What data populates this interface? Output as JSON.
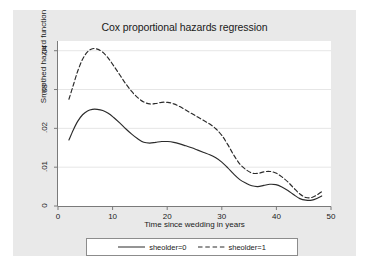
{
  "chart_data": {
    "type": "line",
    "title": "Cox proportional hazards regression",
    "xlabel": "Time since wedding in years",
    "ylabel": "Smoothed hazard function",
    "xlim": [
      0,
      50
    ],
    "ylim": [
      0,
      0.0425
    ],
    "xticks": [
      "0",
      "10",
      "20",
      "30",
      "40",
      "50"
    ],
    "xtick_values": [
      0,
      10,
      20,
      30,
      40,
      50
    ],
    "yticks": [
      "0",
      ".01",
      ".02",
      ".03",
      ".04"
    ],
    "ytick_values": [
      0,
      0.01,
      0.02,
      0.03,
      0.04
    ],
    "grid": "horizontal",
    "legend_position": "bottom",
    "series": [
      {
        "name": "sheolder=0",
        "style": "solid",
        "color": "#2b2b2b",
        "x": [
          2.0,
          2.8,
          3.6,
          4.5,
          5.4,
          6.3,
          7.2,
          8.2,
          9.2,
          10.2,
          11.3,
          12.4,
          13.5,
          14.6,
          15.7,
          16.8,
          17.9,
          19.0,
          20.1,
          21.2,
          22.3,
          23.4,
          24.5,
          25.6,
          26.7,
          27.8,
          28.9,
          30.0,
          31.1,
          32.2,
          33.3,
          34.4,
          35.5,
          36.6,
          37.7,
          38.8,
          39.9,
          41.0,
          42.1,
          43.2,
          44.3,
          45.4,
          46.5,
          47.5,
          48.3
        ],
        "y": [
          0.017,
          0.0196,
          0.0218,
          0.0235,
          0.0245,
          0.0249,
          0.0249,
          0.0246,
          0.0239,
          0.0228,
          0.0214,
          0.0199,
          0.0185,
          0.0173,
          0.0164,
          0.0162,
          0.0164,
          0.0166,
          0.0166,
          0.0164,
          0.016,
          0.0155,
          0.015,
          0.0144,
          0.0138,
          0.0132,
          0.0124,
          0.0113,
          0.0098,
          0.0082,
          0.0068,
          0.0059,
          0.0052,
          0.005,
          0.0053,
          0.0056,
          0.0055,
          0.0049,
          0.004,
          0.0029,
          0.0019,
          0.0015,
          0.0015,
          0.002,
          0.0026
        ]
      },
      {
        "name": "sheolder=1",
        "style": "dashed",
        "color": "#2b2b2b",
        "x": [
          2.0,
          2.8,
          3.6,
          4.5,
          5.4,
          6.3,
          7.2,
          8.2,
          9.2,
          10.2,
          11.3,
          12.4,
          13.5,
          14.6,
          15.7,
          16.8,
          17.9,
          19.0,
          20.1,
          21.2,
          22.3,
          23.4,
          24.5,
          25.6,
          26.7,
          27.8,
          28.9,
          30.0,
          31.1,
          32.2,
          33.3,
          34.4,
          35.5,
          36.6,
          37.7,
          38.8,
          39.9,
          41.0,
          42.1,
          43.2,
          44.3,
          45.4,
          46.5,
          47.5,
          48.3
        ],
        "y": [
          0.0275,
          0.0311,
          0.0347,
          0.0378,
          0.0397,
          0.0405,
          0.0404,
          0.0396,
          0.0381,
          0.0361,
          0.0338,
          0.0315,
          0.0295,
          0.0279,
          0.0268,
          0.0263,
          0.0264,
          0.0267,
          0.0267,
          0.0263,
          0.0256,
          0.0247,
          0.0238,
          0.0229,
          0.022,
          0.0211,
          0.0199,
          0.0182,
          0.0158,
          0.0131,
          0.0108,
          0.0094,
          0.0085,
          0.0084,
          0.0088,
          0.0089,
          0.0085,
          0.0075,
          0.0062,
          0.0046,
          0.0031,
          0.0022,
          0.0022,
          0.0029,
          0.0037
        ]
      }
    ]
  },
  "legend": {
    "entries": [
      {
        "label": "sheolder=0",
        "style": "solid"
      },
      {
        "label": "sheolder=1",
        "style": "dashed"
      }
    ]
  }
}
